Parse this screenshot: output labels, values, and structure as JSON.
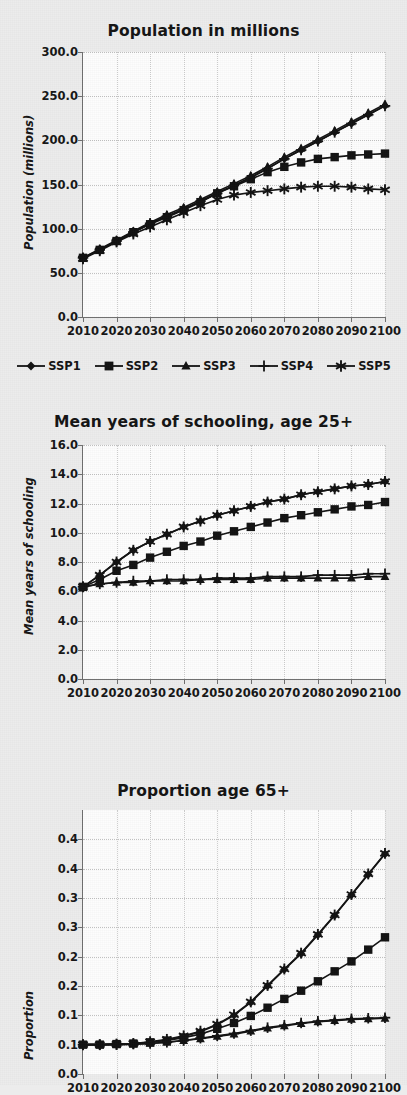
{
  "document": {
    "background_color": "#ececec",
    "panel_background": "#fdfdfd",
    "ink_color": "#121212"
  },
  "legend": {
    "items": [
      {
        "label": "SSP1",
        "marker": "diamond-marker-icon"
      },
      {
        "label": "SSP2",
        "marker": "square-marker-icon"
      },
      {
        "label": "SSP3",
        "marker": "triangle-marker-icon"
      },
      {
        "label": "SSP4",
        "marker": "plus-marker-icon"
      },
      {
        "label": "SSP5",
        "marker": "asterisk-marker-icon"
      }
    ]
  },
  "chart_data": [
    {
      "id": "population",
      "type": "line",
      "title": "Population in millions",
      "xlabel": "",
      "ylabel": "Population (millions)",
      "x": [
        2010,
        2015,
        2020,
        2025,
        2030,
        2035,
        2040,
        2045,
        2050,
        2055,
        2060,
        2065,
        2070,
        2075,
        2080,
        2085,
        2090,
        2095,
        2100
      ],
      "xticks": [
        "2010",
        "2020",
        "2030",
        "2040",
        "2050",
        "2060",
        "2070",
        "2080",
        "2090",
        "2100"
      ],
      "xlim": [
        2010,
        2100
      ],
      "ylim": [
        0,
        300
      ],
      "yticks": [
        "0.0",
        "50.0",
        "100.0",
        "150.0",
        "200.0",
        "250.0",
        "300.0"
      ],
      "ytick_values": [
        0,
        50,
        100,
        150,
        200,
        250,
        300
      ],
      "grid": true,
      "legend_position": "below",
      "series": [
        {
          "name": "SSP1",
          "marker": "diamond",
          "values": [
            67,
            76,
            86,
            96,
            106,
            114,
            122,
            131,
            140,
            149,
            158,
            168,
            179,
            189,
            199,
            209,
            219,
            229,
            239
          ]
        },
        {
          "name": "SSP2",
          "marker": "square",
          "values": [
            67,
            76,
            86,
            96,
            105,
            113,
            121,
            130,
            140,
            148,
            156,
            164,
            170,
            175,
            179,
            181,
            183,
            184,
            185
          ]
        },
        {
          "name": "SSP3",
          "marker": "triangle",
          "values": [
            67,
            77,
            87,
            97,
            107,
            116,
            124,
            133,
            142,
            151,
            160,
            170,
            181,
            191,
            201,
            211,
            221,
            231,
            241
          ]
        },
        {
          "name": "SSP4",
          "marker": "plus",
          "values": [
            67,
            76,
            86,
            96,
            106,
            114,
            122,
            131,
            140,
            149,
            158,
            168,
            179,
            189,
            199,
            209,
            219,
            229,
            239
          ]
        },
        {
          "name": "SSP5",
          "marker": "asterisk",
          "values": [
            66,
            75,
            85,
            94,
            102,
            110,
            118,
            126,
            133,
            138,
            141,
            143,
            145,
            147,
            148,
            148,
            147,
            145,
            144
          ]
        }
      ]
    },
    {
      "id": "schooling",
      "type": "line",
      "title": "Mean years of schooling, age 25+",
      "xlabel": "",
      "ylabel": "Mean years of schooling",
      "x": [
        2010,
        2015,
        2020,
        2025,
        2030,
        2035,
        2040,
        2045,
        2050,
        2055,
        2060,
        2065,
        2070,
        2075,
        2080,
        2085,
        2090,
        2095,
        2100
      ],
      "xticks": [
        "2010",
        "2020",
        "2030",
        "2040",
        "2050",
        "2060",
        "2070",
        "2080",
        "2090",
        "2100"
      ],
      "xlim": [
        2010,
        2100
      ],
      "ylim": [
        0,
        16
      ],
      "yticks": [
        "0.0",
        "2.0",
        "4.0",
        "6.0",
        "8.0",
        "10.0",
        "12.0",
        "14.0",
        "16.0"
      ],
      "ytick_values": [
        0,
        2,
        4,
        6,
        8,
        10,
        12,
        14,
        16
      ],
      "grid": true,
      "legend_position": "none",
      "series": [
        {
          "name": "SSP1",
          "marker": "diamond",
          "values": [
            6.3,
            7.1,
            8.0,
            8.8,
            9.4,
            9.9,
            10.4,
            10.8,
            11.2,
            11.5,
            11.8,
            12.1,
            12.3,
            12.6,
            12.8,
            13.0,
            13.2,
            13.3,
            13.5
          ]
        },
        {
          "name": "SSP2",
          "marker": "square",
          "values": [
            6.3,
            6.8,
            7.4,
            7.8,
            8.3,
            8.7,
            9.1,
            9.4,
            9.8,
            10.1,
            10.4,
            10.7,
            11.0,
            11.2,
            11.4,
            11.6,
            11.8,
            11.9,
            12.1
          ]
        },
        {
          "name": "SSP3",
          "marker": "triangle",
          "values": [
            6.3,
            6.5,
            6.6,
            6.6,
            6.7,
            6.7,
            6.7,
            6.8,
            6.8,
            6.8,
            6.8,
            6.9,
            6.9,
            6.9,
            6.9,
            6.9,
            6.9,
            7.0,
            7.0
          ]
        },
        {
          "name": "SSP4",
          "marker": "plus",
          "values": [
            6.3,
            6.5,
            6.6,
            6.7,
            6.7,
            6.8,
            6.8,
            6.8,
            6.9,
            6.9,
            6.9,
            7.0,
            7.0,
            7.0,
            7.1,
            7.1,
            7.1,
            7.2,
            7.2
          ]
        },
        {
          "name": "SSP5",
          "marker": "asterisk",
          "values": [
            6.3,
            7.1,
            8.0,
            8.8,
            9.4,
            9.9,
            10.4,
            10.8,
            11.2,
            11.5,
            11.8,
            12.1,
            12.3,
            12.6,
            12.8,
            13.0,
            13.2,
            13.3,
            13.5
          ]
        }
      ]
    },
    {
      "id": "proportion",
      "type": "line",
      "title": "Proportion age 65+",
      "xlabel": "",
      "ylabel": "Proportion",
      "x": [
        2010,
        2015,
        2020,
        2025,
        2030,
        2035,
        2040,
        2045,
        2050,
        2055,
        2060,
        2065,
        2070,
        2075,
        2080,
        2085,
        2090,
        2095,
        2100
      ],
      "xticks": [
        "2010",
        "2020",
        "2030",
        "2040",
        "2050",
        "2060",
        "2070",
        "2080",
        "2090",
        "2100"
      ],
      "xlim": [
        2010,
        2100
      ],
      "ylim": [
        0,
        0.45
      ],
      "yticks": [
        "0.0",
        "0.1",
        "0.1",
        "0.2",
        "0.2",
        "0.3",
        "0.3",
        "0.4",
        "0.4"
      ],
      "ytick_values": [
        0,
        0.05,
        0.1,
        0.15,
        0.2,
        0.25,
        0.3,
        0.35,
        0.4
      ],
      "grid": true,
      "legend_position": "none",
      "clipped_bottom": true,
      "series": [
        {
          "name": "SSP1",
          "marker": "diamond",
          "values": [
            0.05,
            0.05,
            0.051,
            0.052,
            0.054,
            0.058,
            0.064,
            0.072,
            0.084,
            0.1,
            0.122,
            0.15,
            0.178,
            0.205,
            0.237,
            0.27,
            0.305,
            0.34,
            0.375
          ]
        },
        {
          "name": "SSP2",
          "marker": "square",
          "values": [
            0.05,
            0.05,
            0.051,
            0.052,
            0.054,
            0.057,
            0.062,
            0.068,
            0.077,
            0.087,
            0.099,
            0.113,
            0.128,
            0.142,
            0.158,
            0.175,
            0.192,
            0.212,
            0.233
          ]
        },
        {
          "name": "SSP3",
          "marker": "triangle",
          "values": [
            0.05,
            0.05,
            0.05,
            0.051,
            0.052,
            0.054,
            0.057,
            0.06,
            0.064,
            0.068,
            0.073,
            0.078,
            0.082,
            0.086,
            0.089,
            0.091,
            0.093,
            0.094,
            0.095
          ]
        },
        {
          "name": "SSP4",
          "marker": "plus",
          "values": [
            0.05,
            0.05,
            0.05,
            0.051,
            0.052,
            0.054,
            0.057,
            0.061,
            0.065,
            0.069,
            0.074,
            0.079,
            0.083,
            0.087,
            0.09,
            0.092,
            0.094,
            0.095,
            0.096
          ]
        },
        {
          "name": "SSP5",
          "marker": "asterisk",
          "values": [
            0.05,
            0.05,
            0.051,
            0.052,
            0.055,
            0.059,
            0.065,
            0.073,
            0.085,
            0.101,
            0.123,
            0.151,
            0.179,
            0.206,
            0.238,
            0.271,
            0.306,
            0.341,
            0.376
          ]
        }
      ]
    }
  ]
}
